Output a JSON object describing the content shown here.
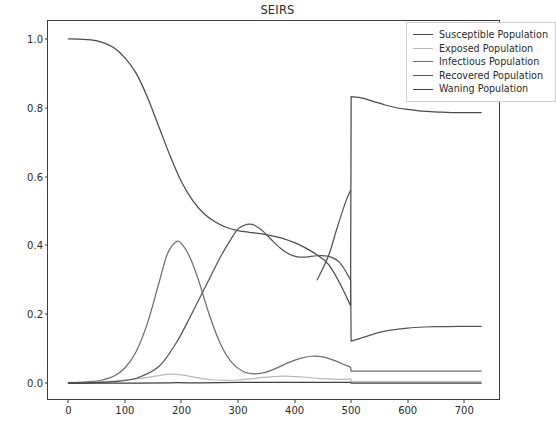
{
  "chart_data": {
    "type": "line",
    "title": "SEIRS",
    "xlabel": "",
    "ylabel": "",
    "xlim": [
      -36,
      765
    ],
    "ylim": [
      -0.052,
      1.052
    ],
    "xticks": [
      0,
      100,
      200,
      300,
      400,
      500,
      600,
      700
    ],
    "yticks": [
      "0.0",
      "0.2",
      "0.4",
      "0.6",
      "0.8",
      "1.0"
    ],
    "ytick_values": [
      0.0,
      0.2,
      0.4,
      0.6,
      0.8,
      1.0
    ],
    "grid": false,
    "legend_position": "upper right",
    "event_marker": {
      "x": 500,
      "description": "discontinuous reset of populations"
    },
    "series": [
      {
        "name": "Susceptible Population",
        "color": "#4b4b4b",
        "x": [
          0,
          20,
          40,
          60,
          80,
          100,
          120,
          140,
          160,
          180,
          200,
          220,
          240,
          260,
          280,
          300,
          320,
          340,
          360,
          380,
          400,
          420,
          440,
          460,
          480,
          499,
          500,
          520,
          540,
          560,
          580,
          600,
          620,
          640,
          660,
          680,
          700,
          710,
          730
        ],
        "y": [
          1.0,
          0.999,
          0.997,
          0.99,
          0.975,
          0.945,
          0.9,
          0.83,
          0.745,
          0.66,
          0.585,
          0.53,
          0.492,
          0.468,
          0.452,
          0.443,
          0.438,
          0.434,
          0.428,
          0.42,
          0.408,
          0.392,
          0.372,
          0.345,
          0.29,
          0.225,
          0.832,
          0.828,
          0.818,
          0.808,
          0.8,
          0.795,
          0.791,
          0.789,
          0.787,
          0.786,
          0.786,
          0.786,
          0.786
        ]
      },
      {
        "name": "Exposed Population",
        "color": "#b9b9b9",
        "x": [
          0,
          40,
          80,
          120,
          160,
          180,
          200,
          220,
          240,
          260,
          280,
          300,
          320,
          340,
          360,
          380,
          400,
          420,
          440,
          460,
          480,
          499,
          500,
          520,
          540,
          560,
          600,
          650,
          700,
          730
        ],
        "y": [
          0.002,
          0.003,
          0.006,
          0.012,
          0.022,
          0.026,
          0.024,
          0.018,
          0.012,
          0.009,
          0.008,
          0.009,
          0.012,
          0.016,
          0.019,
          0.02,
          0.019,
          0.017,
          0.014,
          0.012,
          0.011,
          0.012,
          0.004,
          0.004,
          0.004,
          0.004,
          0.004,
          0.004,
          0.004,
          0.004
        ]
      },
      {
        "name": "Infectious Population",
        "color": "#6e6e6e",
        "x": [
          0,
          20,
          40,
          60,
          80,
          100,
          120,
          140,
          160,
          175,
          190,
          200,
          215,
          230,
          250,
          270,
          290,
          310,
          330,
          350,
          370,
          390,
          410,
          430,
          450,
          470,
          490,
          499,
          500,
          520,
          560,
          600,
          650,
          700,
          730
        ],
        "y": [
          0.001,
          0.002,
          0.004,
          0.009,
          0.02,
          0.044,
          0.092,
          0.175,
          0.29,
          0.375,
          0.41,
          0.405,
          0.365,
          0.3,
          0.195,
          0.11,
          0.058,
          0.033,
          0.027,
          0.032,
          0.045,
          0.06,
          0.072,
          0.078,
          0.076,
          0.066,
          0.052,
          0.046,
          0.035,
          0.035,
          0.035,
          0.035,
          0.035,
          0.035,
          0.035
        ]
      },
      {
        "name": "Recovered Population",
        "color": "#555555",
        "x": [
          0,
          40,
          80,
          120,
          160,
          190,
          210,
          230,
          250,
          270,
          290,
          300,
          310,
          320,
          330,
          345,
          360,
          375,
          390,
          405,
          420,
          440,
          460,
          480,
          499,
          500,
          520,
          545,
          570,
          600,
          630,
          660,
          690,
          710,
          730
        ],
        "y": [
          0.0,
          0.001,
          0.004,
          0.014,
          0.048,
          0.115,
          0.175,
          0.24,
          0.305,
          0.37,
          0.425,
          0.448,
          0.458,
          0.462,
          0.458,
          0.44,
          0.415,
          0.392,
          0.375,
          0.367,
          0.366,
          0.37,
          0.368,
          0.35,
          0.3,
          0.122,
          0.132,
          0.145,
          0.154,
          0.16,
          0.163,
          0.164,
          0.165,
          0.165,
          0.165
        ]
      },
      {
        "name": "Waning Population",
        "color": "#3f3f3f",
        "x": [
          0,
          60,
          120,
          180,
          240,
          300,
          360,
          420,
          460,
          480,
          499,
          500,
          520,
          560,
          600,
          650,
          700,
          730
        ],
        "y": [
          0.0,
          0.0,
          0.0,
          0.001,
          0.001,
          0.002,
          0.002,
          0.002,
          0.002,
          0.002,
          0.002,
          0.0,
          0.0,
          0.0,
          0.0,
          0.0,
          0.0,
          0.0
        ]
      }
    ],
    "post_event_rise": {
      "name": "Infectious Population",
      "note": "steep rise from 0.225 to 0.56 just before t=500 shown on susceptible-crossing branch",
      "x": [
        440,
        460,
        475,
        490,
        499
      ],
      "y": [
        0.3,
        0.37,
        0.45,
        0.525,
        0.56
      ]
    }
  },
  "legend": {
    "entries": [
      {
        "label": "Susceptible Population",
        "color": "#4b4b4b"
      },
      {
        "label": "Exposed Population",
        "color": "#b9b9b9"
      },
      {
        "label": "Infectious Population",
        "color": "#6e6e6e"
      },
      {
        "label": "Recovered Population",
        "color": "#555555"
      },
      {
        "label": "Waning Population",
        "color": "#3f3f3f"
      }
    ]
  }
}
